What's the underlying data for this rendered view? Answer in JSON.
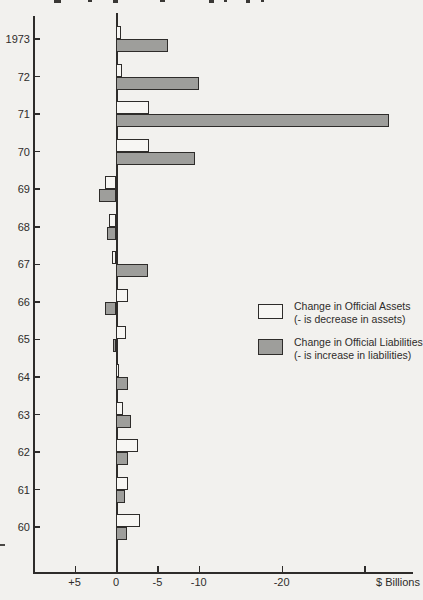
{
  "figure": {
    "x_axis": {
      "unit_label": "$ Billions",
      "ticks": [
        {
          "label": "+5",
          "value": 5
        },
        {
          "label": "0",
          "value": 0
        },
        {
          "label": "-5",
          "value": -5
        },
        {
          "label": "-10",
          "value": -10
        },
        {
          "label": "-20",
          "value": -20
        },
        {
          "label": "",
          "value": -30
        }
      ]
    },
    "legend": {
      "assets_label": "Change in Official Assets",
      "assets_sub": "(- is decrease in assets)",
      "liabilities_label": "Change in Official Liabilities",
      "liabilities_sub": "(- is increase in liabilities)"
    },
    "colors": {
      "ink": "#2e2c2a",
      "assets_fill": "#f7f6f3",
      "liabilities_fill": "#9e9e9b",
      "paper": "#f2f1ee"
    }
  },
  "chart_data": {
    "type": "bar",
    "orientation": "horizontal",
    "title": "",
    "xlabel": "$ Billions",
    "note": "negative values extend to the right; - is decrease in assets / increase in liabilities",
    "xlim": [
      7,
      -35
    ],
    "x_ticks": [
      5,
      0,
      -5,
      -10,
      -20,
      -30
    ],
    "grid": false,
    "legend_position": "middle-right",
    "categories": [
      "1973",
      "72",
      "71",
      "70",
      "69",
      "68",
      "67",
      "66",
      "65",
      "64",
      "63",
      "62",
      "61",
      "60"
    ],
    "series": [
      {
        "name": "Change in Official Assets",
        "fill": "#f7f6f3",
        "values": [
          -0.6,
          -0.7,
          -4.0,
          -4.0,
          1.3,
          0.9,
          0.5,
          -1.5,
          -1.2,
          -0.4,
          -0.9,
          -2.7,
          -1.5,
          -2.9
        ]
      },
      {
        "name": "Change in Official Liabilities",
        "fill": "#9e9e9b",
        "values": [
          -6.3,
          -10.0,
          -33.0,
          -9.5,
          2.0,
          1.1,
          -3.9,
          1.3,
          0.3,
          -1.4,
          -1.8,
          -1.5,
          -1.1,
          -1.3
        ]
      }
    ]
  }
}
